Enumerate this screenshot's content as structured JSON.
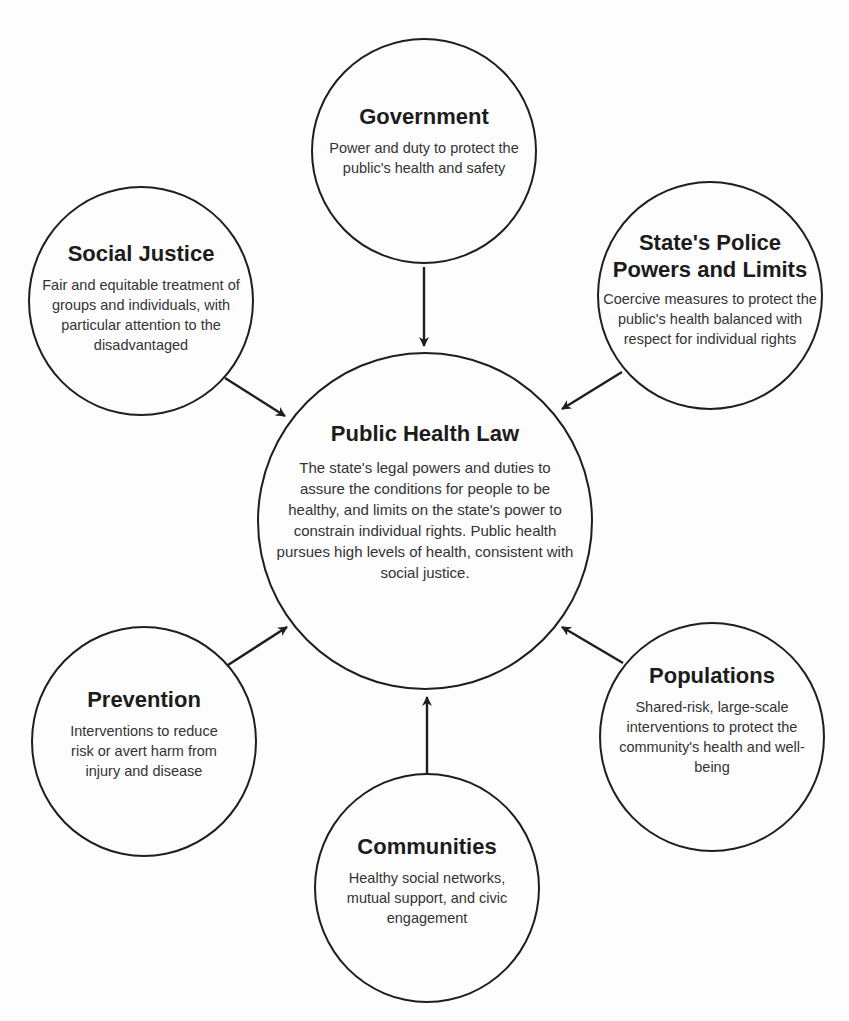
{
  "diagram": {
    "center": {
      "title": "Public Health Law",
      "description": "The state's legal powers and duties to assure the conditions for people to be healthy, and limits on the state's power to constrain individual rights. Public health pursues high levels of health, consistent with social justice."
    },
    "nodes": [
      {
        "id": "government",
        "title": "Government",
        "description": "Power and duty to protect the public's health and safety"
      },
      {
        "id": "social-justice",
        "title": "Social Justice",
        "description": "Fair and equitable treatment of groups and individuals, with particular attention to the disadvantaged"
      },
      {
        "id": "states-police-powers",
        "title": "State's Police Powers and Limits",
        "description": "Coercive measures to protect the public's health balanced with respect for individual rights"
      },
      {
        "id": "prevention",
        "title": "Prevention",
        "description": "Interventions to reduce risk or avert harm from injury and disease"
      },
      {
        "id": "populations",
        "title": "Populations",
        "description": "Shared-risk, large-scale interventions to protect the community's health and well-being"
      },
      {
        "id": "communities",
        "title": "Communities",
        "description": "Healthy social networks, mutual support, and civic engagement"
      }
    ],
    "edges": [
      {
        "from": "government",
        "to": "center"
      },
      {
        "from": "social-justice",
        "to": "center"
      },
      {
        "from": "states-police-powers",
        "to": "center"
      },
      {
        "from": "prevention",
        "to": "center"
      },
      {
        "from": "populations",
        "to": "center"
      },
      {
        "from": "communities",
        "to": "center"
      }
    ],
    "colors": {
      "stroke": "#1e1e1e",
      "background": "#fdfdfd",
      "text": "#2a2a2a"
    }
  }
}
